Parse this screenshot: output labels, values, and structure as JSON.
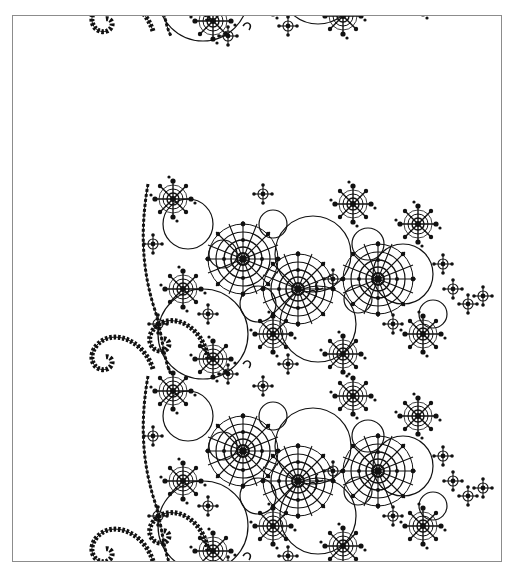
{
  "page": {
    "page_number": "",
    "running_title": ""
  },
  "figure": {
    "colors": {
      "ink": "#111111",
      "paper": "#ffffff",
      "frame": "#8c8c8c"
    },
    "tiers": [
      {
        "name": "top",
        "offset_y": -170
      },
      {
        "name": "middle",
        "offset_y": 0
      },
      {
        "name": "bottom",
        "offset_y": 195
      }
    ]
  }
}
